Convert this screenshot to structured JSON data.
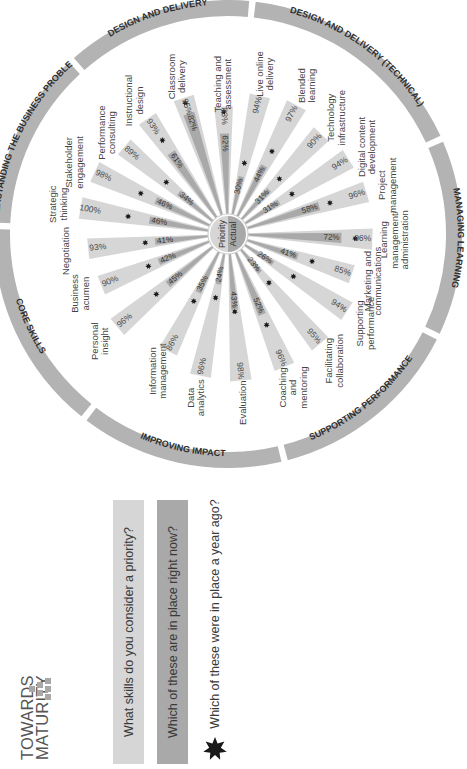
{
  "brand": {
    "line1": "TOWARDS",
    "line2": "MATURITY"
  },
  "legend": {
    "priority": "What skills do you consider a priority?",
    "actual": "Which of these are in place right now?",
    "year_ago": "Which of these were in place a year ago?"
  },
  "center": {
    "top": "Priority",
    "bottom": "Actual"
  },
  "colors": {
    "priority": "#d6d6d6",
    "actual": "#a9a9a9",
    "ring": "#b3b3b3",
    "star": "#1a1a1a",
    "text": "#4a4a4a"
  },
  "chart_data": {
    "type": "radial-bar",
    "orientation_note": "Entire figure rotated 90° counter-clockwise",
    "categories_groups": [
      {
        "name": "CORE SKILLS",
        "skills": [
          "Negotiation",
          "Business acumen",
          "Personal insight"
        ]
      },
      {
        "name": "UNDERSTANDING THE BUSINESS PROBLEM",
        "skills": [
          "Strategic thinking",
          "Stakeholder engagement",
          "Performance consulting"
        ]
      },
      {
        "name": "DESIGN AND DELIVERY",
        "skills": [
          "Instructional design",
          "Classroom delivery",
          "Teaching and assessment"
        ]
      },
      {
        "name": "DESIGN AND DELIVERY (TECHNICAL)",
        "skills": [
          "Live online delivery",
          "Blended learning",
          "Technology infrastructure",
          "Digital content development"
        ]
      },
      {
        "name": "MANAGING LEARNING",
        "skills": [
          "Project management",
          "Learning management/ administration",
          "Marketing and communications"
        ]
      },
      {
        "name": "SUPPORTING PERFORMANCE",
        "skills": [
          "Supporting performance",
          "Facilitating collaboration",
          "Coaching and mentoring"
        ]
      },
      {
        "name": "IMPROVING IMPACT",
        "skills": [
          "Evaluation",
          "Data analytics",
          "Information management"
        ]
      }
    ],
    "series": [
      {
        "name": "Priority",
        "unit": "%"
      },
      {
        "name": "Actual",
        "unit": "%"
      },
      {
        "name": "Year ago (star marker)",
        "unit": "%"
      }
    ],
    "skills": [
      {
        "label": "Strategic thinking",
        "lines": [
          "Strategic",
          "thinking"
        ],
        "angle": 190,
        "priority": 100,
        "actual": 46,
        "year_ago": 58
      },
      {
        "label": "Stakeholder engagement",
        "lines": [
          "Stakeholder",
          "engagement"
        ],
        "angle": 205,
        "priority": 98,
        "actual": 46,
        "year_ago": 54
      },
      {
        "label": "Performance consulting",
        "lines": [
          "Performance",
          "consulting"
        ],
        "angle": 220,
        "priority": 89,
        "actual": 34,
        "year_ago": 42
      },
      {
        "label": "Instructional design",
        "lines": [
          "Instructional",
          "design"
        ],
        "angle": 235,
        "priority": 93,
        "actual": 61,
        "year_ago": 68
      },
      {
        "label": "Classroom delivery",
        "lines": [
          "Classroom",
          "delivery"
        ],
        "angle": 252,
        "priority": 95,
        "actual": 82,
        "year_ago": 86
      },
      {
        "label": "Teaching and assessment",
        "lines": [
          "Teaching and",
          "assessment"
        ],
        "angle": 268,
        "priority": 83,
        "actual": 62,
        "year_ago": 74
      },
      {
        "label": "Live online delivery",
        "lines": [
          "Live online",
          "delivery"
        ],
        "angle": 283,
        "priority": 94,
        "actual": 30,
        "year_ago": 36
      },
      {
        "label": "Blended learning",
        "lines": [
          "Blended",
          "learning"
        ],
        "angle": 298,
        "priority": 97,
        "actual": 44,
        "year_ago": 52
      },
      {
        "label": "Technology infrastructure",
        "lines": [
          "Technology",
          "infrastructure"
        ],
        "angle": 313,
        "priority": 90,
        "actual": 31,
        "year_ago": 38
      },
      {
        "label": "Digital content development",
        "lines": [
          "Digital content",
          "development"
        ],
        "angle": 328,
        "priority": 94,
        "actual": 31,
        "year_ago": 38
      },
      {
        "label": "Project management",
        "lines": [
          "Project",
          "management"
        ],
        "angle": 343,
        "priority": 96,
        "actual": 58,
        "year_ago": 62
      },
      {
        "label": "Learning management/ administration",
        "lines": [
          "Learning",
          "management/",
          "administration"
        ],
        "angle": 2,
        "priority": 96,
        "actual": 72,
        "year_ago": 78
      },
      {
        "label": "Marketing and communications",
        "lines": [
          "Marketing and",
          "communications"
        ],
        "angle": 18,
        "priority": 85,
        "actual": 41,
        "year_ago": 48
      },
      {
        "label": "Supporting performance",
        "lines": [
          "Supporting",
          "performance"
        ],
        "angle": 33,
        "priority": 94,
        "actual": 26,
        "year_ago": 40
      },
      {
        "label": "Facilitating collaboration",
        "lines": [
          "Facilitating",
          "collaboration"
        ],
        "angle": 50,
        "priority": 95,
        "actual": 23,
        "year_ago": 29
      },
      {
        "label": "Coaching and mentoring",
        "lines": [
          "Coaching",
          "and",
          "mentoring"
        ],
        "angle": 67,
        "priority": 96,
        "actual": 52,
        "year_ago": 56
      },
      {
        "label": "Evaluation",
        "lines": [
          "Evaluation"
        ],
        "angle": 85,
        "priority": 98,
        "actual": 43,
        "year_ago": 40
      },
      {
        "label": "Data analytics",
        "lines": [
          "Data",
          "analytics"
        ],
        "angle": 101,
        "priority": 96,
        "actual": 24,
        "year_ago": 30
      },
      {
        "label": "Information management",
        "lines": [
          "Information",
          "management"
        ],
        "angle": 117,
        "priority": 86,
        "actual": 35,
        "year_ago": 38
      },
      {
        "label": "Personal insight",
        "lines": [
          "Personal",
          "insight"
        ],
        "angle": 140,
        "priority": 96,
        "actual": 45,
        "year_ago": 52
      },
      {
        "label": "Business acumen",
        "lines": [
          "Business",
          "acumen"
        ],
        "angle": 158,
        "priority": 90,
        "actual": 42,
        "year_ago": 46
      },
      {
        "label": "Negotiation",
        "lines": [
          "Negotiation"
        ],
        "angle": 174,
        "priority": 93,
        "actual": 41,
        "year_ago": 44
      }
    ],
    "ring_segments": [
      {
        "label": "CORE SKILLS",
        "start": 128,
        "end": 182
      },
      {
        "label": "UNDERSTANDING THE BUSINESS PROBLEM",
        "start": 182,
        "end": 228
      },
      {
        "label": "DESIGN AND DELIVERY",
        "start": 228,
        "end": 276
      },
      {
        "label": "DESIGN AND DELIVERY (TECHNICAL)",
        "start": 276,
        "end": 336
      },
      {
        "label": "MANAGING LEARNING",
        "start": 336,
        "end": 26
      },
      {
        "label": "SUPPORTING PERFORMANCE",
        "start": 26,
        "end": 76
      },
      {
        "label": "IMPROVING IMPACT",
        "start": 76,
        "end": 128
      }
    ]
  }
}
